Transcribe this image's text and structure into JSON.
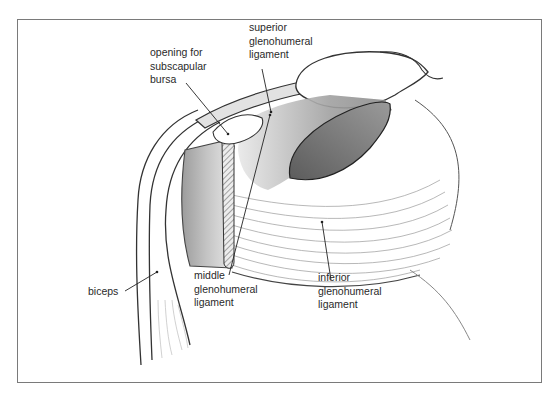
{
  "figure": {
    "labels": {
      "opening": "opening for\nsubscapular\nbursa",
      "superior": "superior\nglenohumeral\nligament",
      "middle": "middle\nglenohumeral\nligament",
      "inferior": "inferior\nglenohumeral\nligament",
      "biceps": "biceps"
    }
  },
  "colors": {
    "frame": "#7a7a7a",
    "ink": "#2a2a2a",
    "shade_dark": "#6e6e6e",
    "shade_mid": "#a8a8a8",
    "shade_light": "#d9d9d9"
  }
}
